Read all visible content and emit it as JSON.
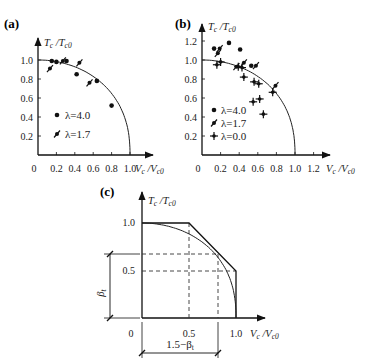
{
  "chart_data": [
    {
      "id": "a",
      "panel_label": "(a)",
      "type": "scatter",
      "xlabel": "Vc/Vc0",
      "ylabel": "Tc/Tc0",
      "xlim": [
        0,
        1.0
      ],
      "ylim": [
        0,
        1.0
      ],
      "xticks": [
        "0",
        "0.2",
        "0.4",
        "0.6",
        "0.8",
        "1.0"
      ],
      "yticks": [
        "0.2",
        "0.4",
        "0.6",
        "0.8",
        "1.0"
      ],
      "grid": false,
      "curve": "elliptical interaction curve from (0,1.0) to (1.0,0)",
      "series": [
        {
          "name": "λ=4.0",
          "marker": "dot",
          "points": [
            [
              0.15,
              0.99
            ],
            [
              0.2,
              0.98
            ],
            [
              0.31,
              0.99
            ],
            [
              0.42,
              0.85
            ],
            [
              0.64,
              0.78
            ],
            [
              0.8,
              0.52
            ]
          ]
        },
        {
          "name": "λ=1.7",
          "marker": "feather",
          "points": [
            [
              0.13,
              0.91
            ],
            [
              0.27,
              0.99
            ],
            [
              0.45,
              0.97
            ],
            [
              0.56,
              0.76
            ]
          ]
        }
      ],
      "legend": [
        {
          "marker": "dot",
          "label": "λ=4.0"
        },
        {
          "marker": "feather",
          "label": "λ=1.7"
        }
      ]
    },
    {
      "id": "b",
      "panel_label": "(b)",
      "type": "scatter",
      "xlabel": "Vc/Vc0",
      "ylabel": "Tc/Tc0",
      "xlim": [
        0,
        1.2
      ],
      "ylim": [
        0,
        1.2
      ],
      "xticks": [
        "0",
        "0.2",
        "0.4",
        "0.6",
        "0.8",
        "1.0",
        "1.2"
      ],
      "yticks": [
        "0.2",
        "0.4",
        "0.6",
        "0.8",
        "1.0",
        "1.2"
      ],
      "grid": false,
      "curve": "elliptical interaction curve from (0,1.0) to (1.0,0)",
      "series": [
        {
          "name": "λ=4.0",
          "marker": "dot",
          "points": [
            [
              0.13,
              1.12
            ],
            [
              0.29,
              1.18
            ],
            [
              0.41,
              1.11
            ],
            [
              0.53,
              0.94
            ]
          ]
        },
        {
          "name": "λ=1.7",
          "marker": "feather",
          "points": [
            [
              0.17,
              1.07
            ],
            [
              0.19,
              1.12
            ],
            [
              0.45,
              0.97
            ],
            [
              0.58,
              0.94
            ],
            [
              0.79,
              0.73
            ],
            [
              0.37,
              0.93
            ]
          ]
        },
        {
          "name": "λ=0.0",
          "marker": "cross",
          "points": [
            [
              0.16,
              0.95
            ],
            [
              0.2,
              0.98
            ],
            [
              0.39,
              0.93
            ],
            [
              0.43,
              0.92
            ],
            [
              0.45,
              0.82
            ],
            [
              0.56,
              0.77
            ],
            [
              0.61,
              0.75
            ],
            [
              0.55,
              0.56
            ],
            [
              0.62,
              0.59
            ],
            [
              0.66,
              0.43
            ],
            [
              0.76,
              0.66
            ]
          ]
        }
      ],
      "legend": [
        {
          "marker": "dot",
          "label": "λ=4.0"
        },
        {
          "marker": "feather",
          "label": "λ=1.7"
        },
        {
          "marker": "cross",
          "label": "λ=0.0"
        }
      ]
    },
    {
      "id": "c",
      "panel_label": "(c)",
      "type": "line",
      "xlabel": "Vc/Vc0",
      "ylabel": "Tc/Tc0",
      "xlim": [
        0,
        1.0
      ],
      "ylim": [
        0,
        1.0
      ],
      "xticks": [
        "0",
        "0.5",
        "1.0"
      ],
      "yticks": [
        "0.5",
        "1.0"
      ],
      "grid": false,
      "series": [
        {
          "name": "trilinear",
          "x": [
            0,
            0.5,
            1.0,
            1.0
          ],
          "y": [
            1.0,
            1.0,
            0.5,
            0
          ]
        },
        {
          "name": "elliptical curve",
          "x": [
            0,
            0.5,
            0.8,
            1.0
          ],
          "y": [
            1.0,
            0.87,
            0.62,
            0
          ]
        }
      ],
      "annotations": [
        {
          "text": "βt",
          "type": "vertical dimension",
          "from": 0,
          "to": 0.68
        },
        {
          "text": "1.5−βt",
          "type": "horizontal dimension",
          "from": 0,
          "to": 0.82
        }
      ],
      "dashed_guides": [
        {
          "orientation": "horizontal",
          "y": 0.68
        },
        {
          "orientation": "horizontal",
          "y": 0.5
        },
        {
          "orientation": "vertical",
          "x": 0.5
        },
        {
          "orientation": "vertical",
          "x": 0.82
        }
      ]
    }
  ],
  "labels": {
    "a": "(a)",
    "b": "(b)",
    "c": "(c)",
    "ylabel_main": "T",
    "ylabel_sub1": "c",
    "ylabel_slash": " /T",
    "ylabel_sub2": "c0",
    "xlabel_main": "V",
    "xlabel_sub1": "c",
    "xlabel_slash": " /V",
    "xlabel_sub2": "c0",
    "legend_a": [
      "λ=4.0",
      "λ=1.7"
    ],
    "legend_b": [
      "λ=4.0",
      "λ=1.7",
      "λ=0.0"
    ],
    "ticks_a_x": [
      "0",
      "0.2",
      "0.4",
      "0.6",
      "0.8",
      "1.0"
    ],
    "ticks_a_y": [
      "0.2",
      "0.4",
      "0.6",
      "0.8",
      "1.0"
    ],
    "ticks_b_x": [
      "0",
      "0.2",
      "0.4",
      "0.6",
      "0.8",
      "1.0",
      "1.2"
    ],
    "ticks_b_y": [
      "0.2",
      "0.4",
      "0.6",
      "0.8",
      "1.0",
      "1.2"
    ],
    "ticks_c_x": [
      "0",
      "0.5",
      "1.0"
    ],
    "ticks_c_y": [
      "0.5",
      "1.0"
    ],
    "beta": "β",
    "beta_sub": "t",
    "dim_bottom_prefix": "1.5−β",
    "dim_bottom_sub": "t"
  }
}
